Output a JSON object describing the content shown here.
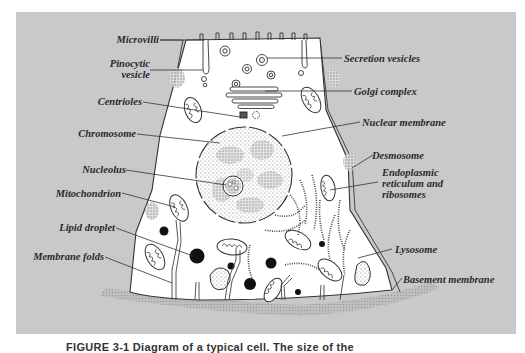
{
  "figure": {
    "caption": "FIGURE 3-1  Diagram of a typical cell. The size of the",
    "panel_color": "#c9c9c9",
    "cell_color": "#ffffff",
    "line_color": "#333333"
  },
  "labels": {
    "left": [
      {
        "id": "microvilli",
        "text": "Microvilli"
      },
      {
        "id": "pinocytic-vesicle",
        "text": "Pinocytic vesicle",
        "line1": "Pinocytic",
        "line2": "vesicle"
      },
      {
        "id": "centrioles",
        "text": "Centrioles"
      },
      {
        "id": "chromosome",
        "text": "Chromosome"
      },
      {
        "id": "nucleolus",
        "text": "Nucleolus"
      },
      {
        "id": "mitochondrion",
        "text": "Mitochondrion"
      },
      {
        "id": "lipid-droplet",
        "text": "Lipid droplet"
      },
      {
        "id": "membrane-folds",
        "text": "Membrane folds"
      }
    ],
    "right": [
      {
        "id": "secretion-vesicles",
        "text": "Secretion vesicles"
      },
      {
        "id": "golgi-complex",
        "text": "Golgi complex"
      },
      {
        "id": "nuclear-membrane",
        "text": "Nuclear membrane"
      },
      {
        "id": "desmosome",
        "text": "Desmosome"
      },
      {
        "id": "endoplasmic-reticulum",
        "text": "Endoplasmic reticulum and ribosomes",
        "line1": "Endoplasmic",
        "line2": "reticulum and",
        "line3": "ribosomes"
      },
      {
        "id": "lysosome",
        "text": "Lysosome"
      },
      {
        "id": "basement-membrane",
        "text": "Basement membrane"
      }
    ]
  }
}
